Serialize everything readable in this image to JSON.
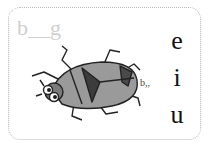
{
  "card": {
    "word_prompt": "b__g",
    "illustration": "bug-illustration",
    "sound_mark": "b,,",
    "options": [
      {
        "letter": "e"
      },
      {
        "letter": "i"
      },
      {
        "letter": "u"
      }
    ]
  }
}
